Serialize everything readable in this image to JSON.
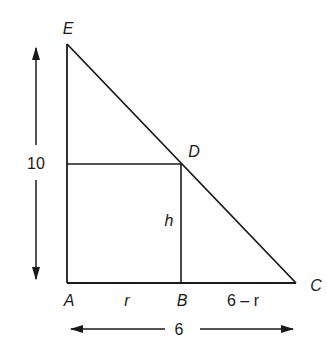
{
  "diagram": {
    "type": "geometry-right-triangle-inscribed-rectangle",
    "stroke_color": "#1a1a1a",
    "points": {
      "E": {
        "label": "E"
      },
      "D": {
        "label": "D"
      },
      "A": {
        "label": "A"
      },
      "B": {
        "label": "B"
      },
      "C": {
        "label": "C"
      }
    },
    "segment_labels": {
      "AB": "r",
      "BC": "6 – r",
      "BD": "h"
    },
    "dimensions": {
      "height_AE": "10",
      "base_AC": "6"
    }
  }
}
